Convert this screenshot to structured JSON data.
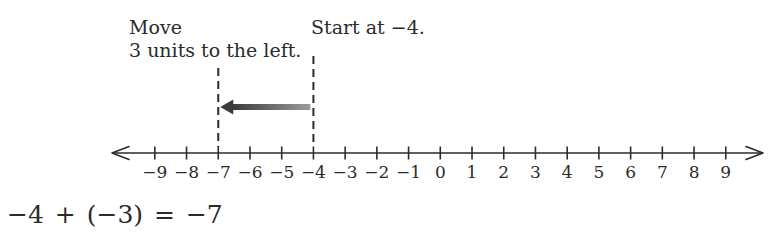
{
  "page": {
    "background": "#ffffff",
    "ink": "#2b2b2b"
  },
  "annotations": {
    "move": {
      "line1": "Move",
      "line2": "3 units to the left."
    },
    "start": {
      "text": "Start at −4."
    }
  },
  "move_arrow": {
    "direction": "left",
    "from_value": -4,
    "to_value": -7,
    "units_moved": 3,
    "color_dark": "#3b3b3b",
    "color_light": "#9c9c9c"
  },
  "number_line": {
    "min": -9,
    "max": 9,
    "step": 1,
    "tick_labels": [
      "−9",
      "−8",
      "−7",
      "−6",
      "−5",
      "−4",
      "−3",
      "−2",
      "−1",
      "0",
      "1",
      "2",
      "3",
      "4",
      "5",
      "6",
      "7",
      "8",
      "9"
    ],
    "dashed_marker_values": [
      -7,
      -4
    ]
  },
  "equation": {
    "text": "−4 + (−3) = −7"
  }
}
